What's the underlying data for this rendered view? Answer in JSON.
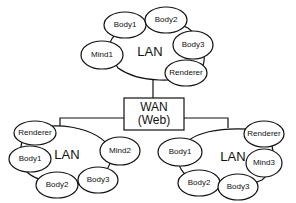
{
  "diagram": {
    "wan": {
      "line1": "WAN",
      "line2": "(Web)"
    },
    "top_lan": {
      "label": "LAN",
      "nodes": [
        "Body1",
        "Body2",
        "Body3",
        "Mind1",
        "Renderer"
      ]
    },
    "left_lan": {
      "label": "LAN",
      "nodes": [
        "Renderer",
        "Body1",
        "Body2",
        "Body3",
        "Mind2"
      ]
    },
    "right_lan": {
      "label": "LAN",
      "nodes": [
        "Renderer",
        "Body1",
        "Mind3",
        "Body2",
        "Body3"
      ]
    }
  }
}
